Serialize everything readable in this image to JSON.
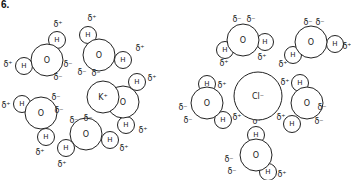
{
  "figure": {
    "number": "6.",
    "ink_color": "#222222",
    "labels": {
      "oxygen": "O",
      "hydrogen": "H",
      "delta_plus": "δ⁺",
      "delta_minus": "δ⁻"
    },
    "clusters": [
      {
        "ion": {
          "label": "K⁺",
          "cx": 103,
          "cy": 97,
          "r": 16
        },
        "waters": [
          {
            "o": [
              47,
              60
            ],
            "h": [
              [
                57,
                40
              ],
              [
                24,
                66
              ]
            ],
            "dp": [
              [
                58,
                24
              ],
              [
                8,
                64
              ]
            ],
            "dm": [
              [
                68,
                64
              ],
              [
                58,
                77
              ]
            ]
          },
          {
            "o": [
              99,
              55
            ],
            "h": [
              [
                88,
                35
              ],
              [
                123,
                60
              ]
            ],
            "dp": [
              [
                92,
                18
              ],
              [
                140,
                48
              ]
            ],
            "dm": [
              [
                82,
                72
              ],
              [
                96,
                73
              ]
            ]
          },
          {
            "o": [
              123,
              102
            ],
            "h": [
              [
                137,
                82
              ],
              [
                126,
                125
              ]
            ],
            "dp": [
              [
                152,
                78
              ],
              [
                143,
                130
              ]
            ],
            "dm": [
              [
                102,
                93
              ],
              [
                100,
                104
              ]
            ]
          },
          {
            "o": [
              41,
              113
            ],
            "h": [
              [
                22,
                104
              ],
              [
                46,
                137
              ]
            ],
            "dp": [
              [
                6,
                105
              ],
              [
                40,
                152
              ]
            ],
            "dm": [
              [
                56,
                97
              ],
              [
                59,
                110
              ]
            ]
          },
          {
            "o": [
              86,
              134
            ],
            "h": [
              [
                66,
                148
              ],
              [
                110,
                140
              ]
            ],
            "dp": [
              [
                62,
                164
              ],
              [
                124,
                148
              ]
            ],
            "dm": [
              [
                74,
                120
              ],
              [
                88,
                118
              ]
            ]
          }
        ]
      },
      {
        "ion": {
          "label": "Cl⁻",
          "cx": 258,
          "cy": 96,
          "r": 24
        },
        "waters": [
          {
            "o": [
              243,
              40
            ],
            "h": [
              [
                225,
                50
              ],
              [
                265,
                42
              ]
            ],
            "dp": [
              [
                224,
                63
              ],
              [
                262,
                57
              ]
            ],
            "dm": [
              [
                237,
                19
              ],
              [
                251,
                19
              ]
            ]
          },
          {
            "o": [
              311,
              42
            ],
            "h": [
              [
                293,
                55
              ],
              [
                335,
                44
              ]
            ],
            "dp": [
              [
                283,
                64
              ],
              [
                347,
                46
              ]
            ],
            "dm": [
              [
                308,
                22
              ],
              [
                320,
                22
              ]
            ]
          },
          {
            "o": [
              207,
              103
            ],
            "h": [
              [
                207,
                84
              ],
              [
                223,
                120
              ]
            ],
            "dp": [
              [
                222,
                85
              ],
              [
                237,
                117
              ]
            ],
            "dm": [
              [
                183,
                107
              ],
              [
                188,
                120
              ]
            ]
          },
          {
            "o": [
              307,
              103
            ],
            "h": [
              [
                300,
                83
              ],
              [
                292,
                124
              ]
            ],
            "dp": [
              [
                285,
                82
              ],
              [
                281,
                117
              ]
            ],
            "dm": [
              [
                322,
                107
              ],
              [
                319,
                121
              ]
            ]
          },
          {
            "o": [
              256,
              155
            ],
            "h": [
              [
                256,
                135
              ],
              [
                268,
                172
              ]
            ],
            "dp": [
              [
                257,
                121
              ],
              [
                282,
                174
              ]
            ],
            "dm": [
              [
                229,
                159
              ],
              [
                232,
                171
              ]
            ]
          }
        ]
      }
    ]
  }
}
